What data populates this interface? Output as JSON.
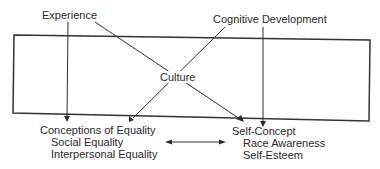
{
  "diagram": {
    "title": "",
    "nodes": {
      "experience": "Experience",
      "cognitive_development": "Cognitive Development",
      "culture": "Culture",
      "conceptions_of_equality": "Conceptions of Equality",
      "social_equality": "Social Equality",
      "interpersonal_equality": "Interpersonal Equality",
      "self_concept": "Self-Concept",
      "race_awareness": "Race Awareness",
      "self_esteem": "Self-Esteem"
    },
    "edges": [
      {
        "from": "Experience",
        "to": "Conceptions of Equality",
        "type": "arrow"
      },
      {
        "from": "Experience",
        "to": "Self-Concept",
        "type": "arrow"
      },
      {
        "from": "Cognitive Development",
        "to": "Conceptions of Equality",
        "type": "arrow"
      },
      {
        "from": "Cognitive Development",
        "to": "Self-Concept",
        "type": "arrow"
      },
      {
        "from": "Conceptions of Equality",
        "to": "Self-Concept",
        "type": "bidirectional-arrow"
      }
    ],
    "container": {
      "label": "Culture",
      "encloses": "crossing influences"
    }
  }
}
